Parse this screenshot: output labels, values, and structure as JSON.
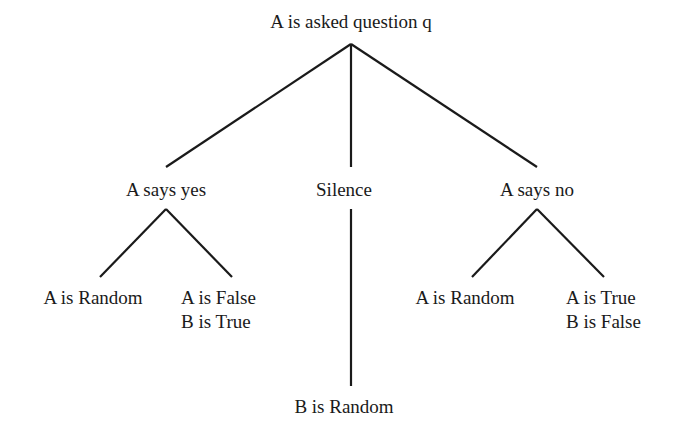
{
  "diagram": {
    "type": "decision-tree",
    "root": {
      "label": "A is asked question q"
    },
    "branches": [
      {
        "label": "A says yes",
        "children": [
          {
            "lines": [
              "A is Random"
            ]
          },
          {
            "lines": [
              "A is False",
              "B is True"
            ]
          }
        ]
      },
      {
        "label": "Silence",
        "children": [
          {
            "lines": [
              "B is Random"
            ]
          }
        ]
      },
      {
        "label": "A says no",
        "children": [
          {
            "lines": [
              "A is Random"
            ]
          },
          {
            "lines": [
              "A is True",
              "B is False"
            ]
          }
        ]
      }
    ]
  },
  "colors": {
    "ink": "#1a1a1a",
    "background": "#ffffff"
  }
}
